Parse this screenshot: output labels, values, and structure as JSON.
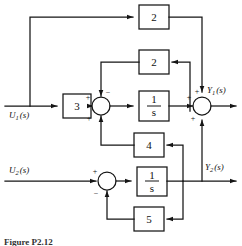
{
  "figure": {
    "caption": "Figure P2.12",
    "kind": "control-system-block-diagram"
  },
  "signals": {
    "u1": "U₁ (s)",
    "u1_base": "U",
    "u1_sub": "1",
    "u1_arg": "(s)",
    "u2_base": "U",
    "u2_sub": "2",
    "u2_arg": "(s)",
    "y1_base": "Y",
    "y1_sub": "1",
    "y1_arg": "(s)",
    "y2_base": "Y",
    "y2_sub": "2",
    "y2_arg": "(s)"
  },
  "blocks": {
    "gain_feedforward_top": "2",
    "gain_inner_feedback": "2",
    "gain_input": "3",
    "integrator_top_num": "1",
    "integrator_top_den": "s",
    "gain_cross_coupling": "4",
    "integrator_bottom_num": "1",
    "integrator_bottom_den": "s",
    "gain_bottom_feedback": "5"
  },
  "signs": {
    "sum1_left": "+",
    "sum1_top": "−",
    "sum1_bottom": "+",
    "sum2_left": "+",
    "sum2_top": "+",
    "sum2_bottom": "+",
    "sum3_left": "+",
    "sum3_bottom": "−"
  },
  "colors": {
    "ink": "#151515",
    "paper": "#ffffff",
    "caption": "#333333"
  }
}
